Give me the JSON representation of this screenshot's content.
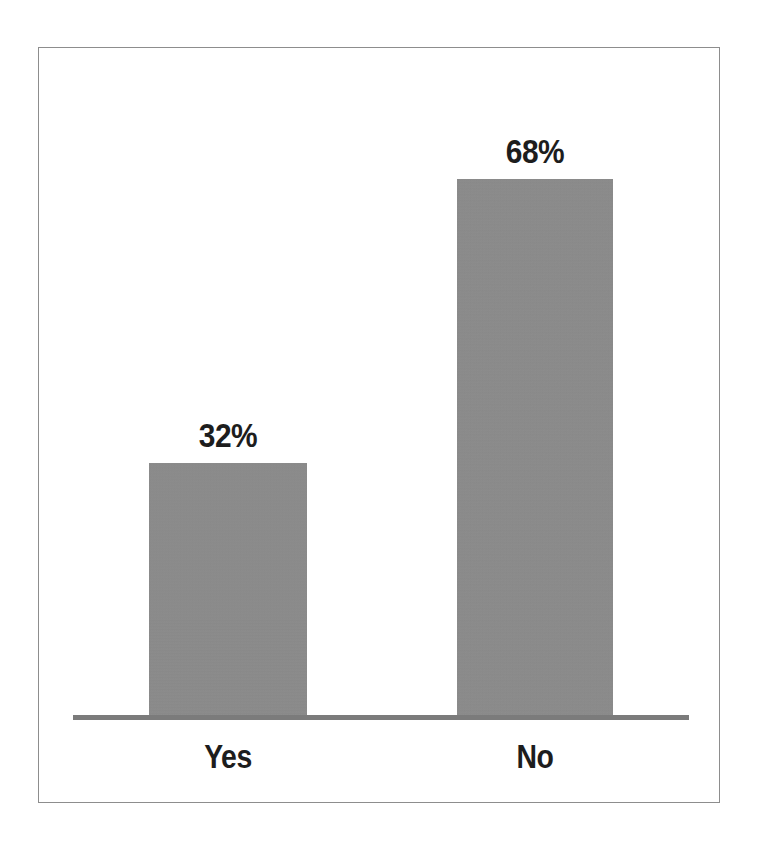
{
  "chart_data": {
    "type": "bar",
    "title": "",
    "subtitle": "",
    "xlabel": "",
    "ylabel": "",
    "categories": [
      "Yes",
      "No"
    ],
    "values": [
      32,
      68
    ],
    "value_labels": [
      "32%",
      "68%"
    ],
    "unit": "%",
    "ylim": [
      0,
      100
    ],
    "grid": false,
    "legend": false,
    "legend_position": "none",
    "orientation": "vertical",
    "series": [
      {
        "name": "Response share",
        "values": [
          32,
          68
        ]
      }
    ],
    "colors": {
      "bar_fill": "#8c8c8c",
      "baseline": "#7b7b7b",
      "frame_border": "#8d8d8d",
      "label_text": "#1d1d1d",
      "background": "#ffffff"
    },
    "axis": {
      "baseline_visible": true,
      "ticks_visible": false,
      "y_axis_visible": false,
      "tick_labels": []
    },
    "annotations": [
      {
        "target": "Yes",
        "text": "32%",
        "position": "above-bar"
      },
      {
        "target": "No",
        "text": "68%",
        "position": "above-bar"
      }
    ]
  }
}
